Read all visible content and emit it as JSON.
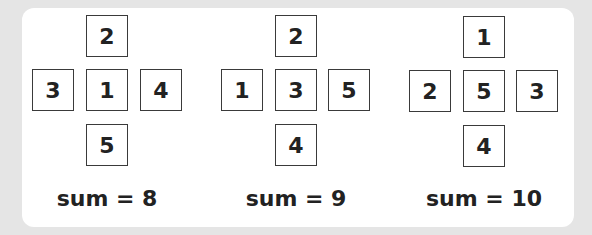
{
  "figures": [
    {
      "top": "2",
      "left": "3",
      "center": "1",
      "right": "4",
      "bottom": "5",
      "sum_label": "sum = 8"
    },
    {
      "top": "2",
      "left": "1",
      "center": "3",
      "right": "5",
      "bottom": "4",
      "sum_label": "sum = 9"
    },
    {
      "top": "1",
      "left": "2",
      "center": "5",
      "right": "3",
      "bottom": "4",
      "sum_label": "sum = 10"
    }
  ]
}
